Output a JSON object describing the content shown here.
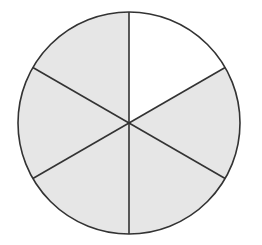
{
  "diagram": {
    "type": "fraction-circle",
    "center": [
      129,
      123
    ],
    "radius": 111,
    "sector_count": 6,
    "start_angle_deg": -90,
    "sectors": [
      {
        "index": 0,
        "position": "top-right",
        "shaded": false
      },
      {
        "index": 1,
        "position": "right",
        "shaded": true
      },
      {
        "index": 2,
        "position": "bottom-right",
        "shaded": true
      },
      {
        "index": 3,
        "position": "bottom-left",
        "shaded": true
      },
      {
        "index": 4,
        "position": "left",
        "shaded": true
      },
      {
        "index": 5,
        "position": "top-left",
        "shaded": true
      }
    ],
    "shaded_count": 5,
    "fraction_shaded": "5/6",
    "colors": {
      "shaded_fill": "#e6e6e6",
      "unshaded_fill": "#ffffff",
      "stroke": "#333333"
    },
    "stroke_width": 1.6
  }
}
